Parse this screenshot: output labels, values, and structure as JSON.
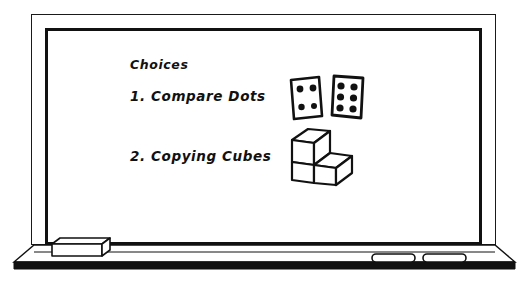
{
  "scene": {
    "kind": "whiteboard-illustration",
    "background_color": "#ffffff",
    "ink_color": "#111111"
  },
  "whiteboard": {
    "title": "Choices",
    "items": [
      {
        "number": "1.",
        "label": "1. Compare Dots",
        "text": "Compare Dots",
        "figure": "dice-pair"
      },
      {
        "number": "2.",
        "label": "2. Copying Cubes",
        "text": "Copying Cubes",
        "figure": "cube-stack"
      }
    ]
  },
  "figures": {
    "dice": {
      "name": "dice-pair",
      "left_die_pips": 4,
      "right_die_pips": 6
    },
    "cubes": {
      "name": "cube-stack",
      "cube_count": 3,
      "shape": "L-shaped block arrangement"
    }
  },
  "tray": {
    "eraser_label": "eraser",
    "marker_count": 2,
    "markers": [
      "marker-1",
      "marker-2"
    ]
  }
}
